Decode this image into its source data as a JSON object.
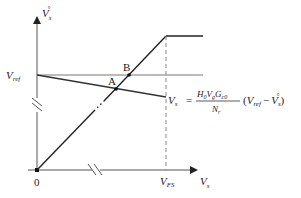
{
  "diagram": {
    "type": "operating-point-diagram",
    "y_axis": {
      "label": "V",
      "subscript": "s",
      "superscript": "°"
    },
    "x_axis": {
      "label": "V",
      "subscript": "s"
    },
    "origin_label": "0",
    "vref_label": {
      "main": "V",
      "sub": "ref"
    },
    "vfs_label": {
      "main": "V",
      "sub": "FS"
    },
    "points": [
      {
        "name": "A",
        "label": "A"
      },
      {
        "name": "B",
        "label": "B"
      }
    ],
    "equation": {
      "lhs_main": "V",
      "lhs_sub": "s",
      "equals": "=",
      "numerator": "H₀V_gG_c0",
      "num_parts": [
        "H",
        "0",
        "V",
        "g",
        "G",
        "c0"
      ],
      "denominator_main": "N",
      "denominator_sub": "r",
      "paren_open": "(",
      "term1_main": "V",
      "term1_sub": "ref",
      "minus": "−",
      "term2_main": "V",
      "term2_sub": "s",
      "term2_sup": "°",
      "paren_close": ")"
    },
    "colors": {
      "line_dark": "#222222",
      "line_gray": "#555555",
      "ref_line": "#777777",
      "dashed": "#888888"
    }
  }
}
